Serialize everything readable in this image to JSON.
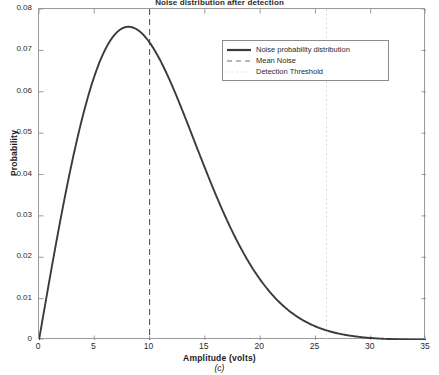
{
  "chart_data": {
    "type": "line",
    "title": "Noise distribution after detection",
    "xlabel": "Amplitude (volts)",
    "ylabel": "Probability",
    "caption": "(c)",
    "xlim": [
      0,
      35
    ],
    "ylim": [
      0,
      0.08
    ],
    "grid": false,
    "legend_position": "upper-right",
    "xticks": [
      0,
      5,
      10,
      15,
      20,
      25,
      30,
      35
    ],
    "xtick_labels": [
      "0",
      "5",
      "10",
      "15",
      "20",
      "25",
      "30",
      "35"
    ],
    "yticks": [
      0,
      0.01,
      0.02,
      0.03,
      0.04,
      0.05,
      0.06,
      0.07,
      0.08
    ],
    "ytick_labels": [
      "0",
      "0.01",
      "0.02",
      "0.03",
      "0.04",
      "0.05",
      "0.06",
      "0.07",
      "0.08"
    ],
    "series": [
      {
        "name": "Noise probability distribution",
        "style": "solid",
        "color": "#3b3b3b",
        "distribution": "rayleigh",
        "sigma": 8.1,
        "peak_x": 8.1,
        "peak_y": 0.0757,
        "x": [
          0,
          0.5,
          1,
          1.5,
          2,
          2.5,
          3,
          3.5,
          4,
          4.5,
          5,
          5.5,
          6,
          6.5,
          7,
          7.5,
          8,
          8.5,
          9,
          9.5,
          10,
          11,
          12,
          13,
          14,
          15,
          16,
          17,
          18,
          19,
          20,
          21,
          22,
          23,
          24,
          25,
          26,
          27,
          28,
          29,
          30,
          31,
          32,
          33,
          34,
          35
        ],
        "y": [
          0,
          0.0076,
          0.0151,
          0.0223,
          0.0292,
          0.0357,
          0.0417,
          0.0471,
          0.0519,
          0.0561,
          0.0596,
          0.0625,
          0.0647,
          0.0663,
          0.0673,
          0.0678,
          0.0678,
          0.0673,
          0.0664,
          0.0651,
          0.0635,
          0.0594,
          0.0544,
          0.0488,
          0.0429,
          0.037,
          0.0313,
          0.0261,
          0.0213,
          0.0171,
          0.0135,
          0.0105,
          0.008,
          0.006,
          0.0044,
          0.0032,
          0.0022,
          0.0015,
          0.001,
          0.0007,
          0.0004,
          0.0003,
          0.0002,
          0.0001,
          0.0001,
          0.0
        ]
      }
    ],
    "annotations": [
      {
        "name": "Mean Noise",
        "type": "vline",
        "x": 10,
        "style": "dashed",
        "color": "#5a5a5a"
      },
      {
        "name": "Detection Threshold",
        "type": "vline",
        "x": 26,
        "style": "dotted",
        "color": "#dcdcdc"
      }
    ],
    "legend": [
      {
        "label": "Noise probability distribution",
        "style": "solid",
        "color": "#3b3b3b"
      },
      {
        "label": "Mean Noise",
        "style": "dashed",
        "color": "#6e6e6e"
      },
      {
        "label": "Detection Threshold",
        "style": "dotted",
        "color": "#e2e2e2"
      }
    ]
  }
}
